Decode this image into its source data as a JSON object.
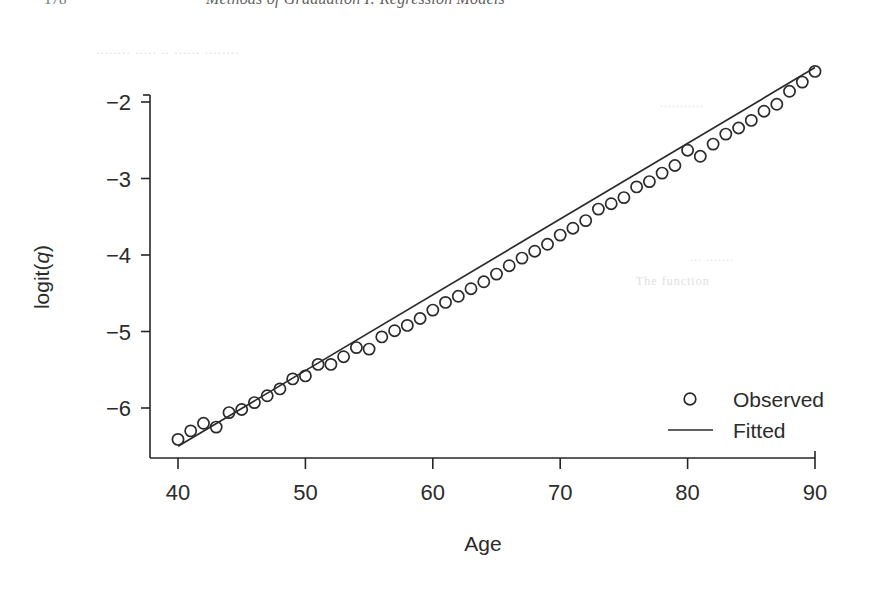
{
  "page": {
    "folio": "178",
    "running_title": "Methods of Graduation I: Regression Models",
    "bleed_through": {
      "line1": "........ ..... .. ...... ........",
      "line2": "...........",
      "line3": "... .......",
      "line4": "The function"
    }
  },
  "figure": {
    "background_color": "#ffffff",
    "ink_color": "#2b2b2b"
  },
  "chart_data": {
    "type": "scatter",
    "title": "",
    "xlabel": "Age",
    "ylabel": "logit(q)",
    "xlim": [
      38,
      90
    ],
    "ylim": [
      -6.65,
      -1.35
    ],
    "grid": false,
    "legend": {
      "position": "bottom-right",
      "entries": [
        {
          "label": "Observed",
          "marker": "open-circle",
          "style": "points"
        },
        {
          "label": "Fitted",
          "marker": "line",
          "style": "line"
        }
      ]
    },
    "xticks": [
      40,
      50,
      60,
      70,
      80,
      90
    ],
    "xtick_labels": [
      "40",
      "50",
      "60",
      "70",
      "80",
      "90"
    ],
    "yticks": [
      -2,
      -3,
      -4,
      -5,
      -6
    ],
    "ytick_labels": [
      "−2",
      "−3",
      "−4",
      "−5",
      "−6"
    ],
    "series": [
      {
        "name": "Observed",
        "marker": "open-circle",
        "x": [
          40,
          41,
          42,
          43,
          44,
          45,
          46,
          47,
          48,
          49,
          50,
          51,
          52,
          53,
          54,
          55,
          56,
          57,
          58,
          59,
          60,
          61,
          62,
          63,
          64,
          65,
          66,
          67,
          68,
          69,
          70,
          71,
          72,
          73,
          74,
          75,
          76,
          77,
          78,
          79,
          80,
          81,
          82,
          83,
          84,
          85,
          86,
          87,
          88,
          89,
          90
        ],
        "y": [
          -6.41,
          -6.3,
          -6.2,
          -6.25,
          -6.06,
          -6.02,
          -5.93,
          -5.84,
          -5.75,
          -5.62,
          -5.58,
          -5.43,
          -5.43,
          -5.33,
          -5.21,
          -5.23,
          -5.07,
          -4.99,
          -4.92,
          -4.83,
          -4.72,
          -4.62,
          -4.54,
          -4.44,
          -4.35,
          -4.25,
          -4.14,
          -4.04,
          -3.95,
          -3.86,
          -3.74,
          -3.65,
          -3.55,
          -3.4,
          -3.33,
          -3.25,
          -3.11,
          -3.04,
          -2.93,
          -2.83,
          -2.63,
          -2.71,
          -2.55,
          -2.42,
          -2.34,
          -2.24,
          -2.12,
          -2.03,
          -1.86,
          -1.74,
          -1.6
        ]
      },
      {
        "name": "Fitted",
        "marker": "line",
        "x": [
          40,
          90
        ],
        "y": [
          -6.5,
          -1.55
        ]
      }
    ]
  }
}
